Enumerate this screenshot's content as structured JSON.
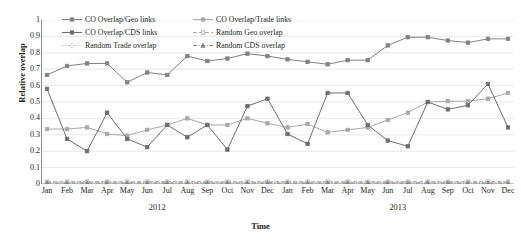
{
  "chart_data": {
    "type": "line",
    "title": "",
    "xlabel": "Time",
    "ylabel": "Relative overlap",
    "ylim": [
      0,
      1
    ],
    "ytick_step": 0.1,
    "yticks": [
      "0",
      "0.1",
      "0.2",
      "0.3",
      "0.4",
      "0.5",
      "0.6",
      "0.7",
      "0.8",
      "0.9",
      "1"
    ],
    "grid": true,
    "grid_axis": "y",
    "legend_position": "top-inside",
    "legend_columns": 2,
    "categories": [
      "Jan",
      "Feb",
      "Mar",
      "Apr",
      "May",
      "Jun",
      "Jul",
      "Aug",
      "Sep",
      "Oct",
      "Nov",
      "Dec",
      "Jan",
      "Feb",
      "Mar",
      "Apr",
      "May",
      "Jun",
      "Jul",
      "Aug",
      "Sep",
      "Oct",
      "Nov",
      "Dec"
    ],
    "groups": [
      {
        "label": "2012",
        "start": 0,
        "end": 11
      },
      {
        "label": "2013",
        "start": 12,
        "end": 23
      }
    ],
    "series": [
      {
        "name": "CO Overlap/Geo links",
        "color": "#808285",
        "line_style": "solid",
        "marker": "square",
        "values": [
          0.665,
          0.72,
          0.735,
          0.735,
          0.62,
          0.68,
          0.665,
          0.78,
          0.75,
          0.765,
          0.795,
          0.78,
          0.76,
          0.745,
          0.73,
          0.755,
          0.755,
          0.845,
          0.895,
          0.895,
          0.875,
          0.862,
          0.885,
          0.885
        ]
      },
      {
        "name": "CO Overlap/Trade links",
        "color": "#A7A9AC",
        "line_style": "solid",
        "marker": "square",
        "values": [
          0.335,
          0.335,
          0.345,
          0.305,
          0.295,
          0.33,
          0.36,
          0.4,
          0.36,
          0.36,
          0.4,
          0.37,
          0.345,
          0.365,
          0.315,
          0.33,
          0.345,
          0.39,
          0.435,
          0.5,
          0.505,
          0.505,
          0.52,
          0.555
        ]
      },
      {
        "name": "CO Overlap/CDS links",
        "color": "#6D6E71",
        "line_style": "solid",
        "marker": "square",
        "values": [
          0.58,
          0.275,
          0.2,
          0.435,
          0.275,
          0.225,
          0.36,
          0.285,
          0.36,
          0.21,
          0.475,
          0.52,
          0.305,
          0.245,
          0.555,
          0.555,
          0.36,
          0.265,
          0.23,
          0.5,
          0.455,
          0.48,
          0.61,
          0.345
        ]
      },
      {
        "name": "Random Geo overlap",
        "color": "#A7A9AC",
        "line_style": "dashed",
        "marker": "square-open",
        "values": [
          0.014,
          0.014,
          0.014,
          0.014,
          0.014,
          0.014,
          0.014,
          0.014,
          0.014,
          0.014,
          0.014,
          0.014,
          0.014,
          0.014,
          0.014,
          0.014,
          0.014,
          0.014,
          0.014,
          0.014,
          0.014,
          0.014,
          0.014,
          0.014
        ]
      },
      {
        "name": "Random Trade overlap",
        "color": "#BCBEC0",
        "line_style": "dotted",
        "marker": "diamond-open",
        "values": [
          0.01,
          0.01,
          0.01,
          0.01,
          0.01,
          0.01,
          0.01,
          0.01,
          0.01,
          0.01,
          0.01,
          0.01,
          0.01,
          0.01,
          0.01,
          0.01,
          0.01,
          0.01,
          0.01,
          0.01,
          0.01,
          0.01,
          0.01,
          0.01
        ]
      },
      {
        "name": "Random CDS overlap",
        "color": "#808285",
        "line_style": "dash-dot",
        "marker": "triangle",
        "values": [
          0.006,
          0.006,
          0.006,
          0.006,
          0.006,
          0.006,
          0.006,
          0.006,
          0.006,
          0.006,
          0.006,
          0.006,
          0.006,
          0.006,
          0.006,
          0.006,
          0.006,
          0.006,
          0.006,
          0.006,
          0.006,
          0.006,
          0.006,
          0.006
        ]
      }
    ]
  },
  "axis": {
    "ylabel": "Relative overlap",
    "xlabel": "Time"
  },
  "legend": {
    "items": [
      {
        "label": "CO Overlap/Geo links"
      },
      {
        "label": "CO Overlap/Trade links"
      },
      {
        "label": "CO Overlap/CDS links"
      },
      {
        "label": "Random Geo overlap"
      },
      {
        "label": "Random Trade overlap"
      },
      {
        "label": "Random CDS overlap"
      }
    ]
  },
  "colors": {
    "geo": "#808285",
    "trade": "#A7A9AC",
    "cds": "#6D6E71",
    "grid": "#D9D9D9",
    "axis": "#808285",
    "text": "#231f20"
  }
}
